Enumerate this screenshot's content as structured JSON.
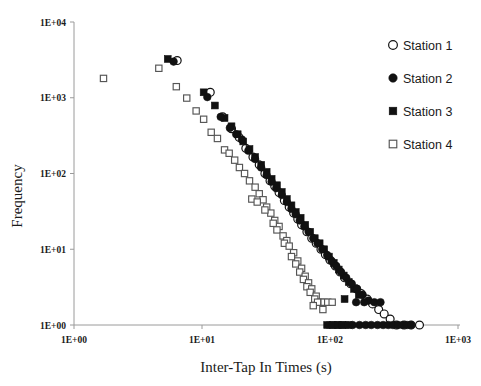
{
  "chart_data": {
    "type": "scatter",
    "title": "",
    "xlabel": "Inter-Tap In Times (s)",
    "ylabel": "Frequency",
    "xscale": "log",
    "yscale": "log",
    "xlim": [
      1,
      1000
    ],
    "ylim": [
      1,
      10000
    ],
    "xticks": [
      "1E+00",
      "1E+01",
      "1E+02",
      "1E+03"
    ],
    "xtick_values": [
      1,
      10,
      100,
      1000
    ],
    "yticks": [
      "1E+00",
      "1E+01",
      "1E+02",
      "1E+03",
      "1E+04"
    ],
    "ytick_values": [
      1,
      10,
      100,
      1000,
      10000
    ],
    "grid": false,
    "legend_position": "right",
    "series": [
      {
        "name": "Station 1",
        "marker": "open-circle",
        "color": "#111111",
        "fill": "#ffffff",
        "points": [
          [
            6.4,
            3100
          ],
          [
            11.6,
            1180
          ],
          [
            14.5,
            560
          ],
          [
            17.0,
            390
          ],
          [
            19.5,
            300
          ],
          [
            22.0,
            215
          ],
          [
            25.0,
            165
          ],
          [
            28.0,
            130
          ],
          [
            31.0,
            100
          ],
          [
            34.0,
            80
          ],
          [
            37.0,
            68
          ],
          [
            40.0,
            56
          ],
          [
            44.0,
            44
          ],
          [
            48.0,
            36
          ],
          [
            52.0,
            30
          ],
          [
            56.0,
            25
          ],
          [
            60.0,
            21
          ],
          [
            66.0,
            17
          ],
          [
            72.0,
            14
          ],
          [
            78.0,
            12
          ],
          [
            85.0,
            10
          ],
          [
            92.0,
            8.5
          ],
          [
            100.0,
            7.2
          ],
          [
            110.0,
            6.0
          ],
          [
            120.0,
            5.0
          ],
          [
            130.0,
            4.2
          ],
          [
            145.0,
            3.5
          ],
          [
            160.0,
            3.0
          ],
          [
            175.0,
            2.6
          ],
          [
            195.0,
            2.2
          ],
          [
            215.0,
            1.9
          ],
          [
            240.0,
            1.6
          ],
          [
            265.0,
            1.4
          ],
          [
            295.0,
            1.2
          ],
          [
            330.0,
            1
          ],
          [
            380.0,
            1
          ],
          [
            430.0,
            1
          ],
          [
            500.0,
            1
          ]
        ]
      },
      {
        "name": "Station 2",
        "marker": "filled-circle",
        "color": "#111111",
        "fill": "#111111",
        "points": [
          [
            6.0,
            3000
          ],
          [
            11.0,
            1020
          ],
          [
            14.0,
            560
          ],
          [
            16.5,
            400
          ],
          [
            18.5,
            330
          ],
          [
            20.5,
            280
          ],
          [
            23.0,
            200
          ],
          [
            26.0,
            155
          ],
          [
            29.0,
            120
          ],
          [
            32.0,
            95
          ],
          [
            35.0,
            78
          ],
          [
            38.0,
            64
          ],
          [
            42.0,
            52
          ],
          [
            46.0,
            42
          ],
          [
            50.0,
            34
          ],
          [
            54.0,
            29
          ],
          [
            58.0,
            24
          ],
          [
            63.0,
            20
          ],
          [
            68.0,
            17
          ],
          [
            74.0,
            14
          ],
          [
            80.0,
            12
          ],
          [
            87.0,
            10
          ],
          [
            95.0,
            8.4
          ],
          [
            103.0,
            7.0
          ],
          [
            112.0,
            6.0
          ],
          [
            122.0,
            5.0
          ],
          [
            134.0,
            4.2
          ],
          [
            148.0,
            3.5
          ],
          [
            163.0,
            3.0
          ],
          [
            180.0,
            2.5
          ],
          [
            200.0,
            2.1
          ],
          [
            222.0,
            2.0
          ],
          [
            248.0,
            2.0
          ],
          [
            160.0,
            2.0
          ],
          [
            185.0,
            2.0
          ],
          [
            150.0,
            1
          ],
          [
            170.0,
            1
          ],
          [
            190.0,
            1
          ],
          [
            210.0,
            1
          ],
          [
            235.0,
            1
          ],
          [
            260.0,
            1
          ],
          [
            285.0,
            1
          ],
          [
            310.0,
            1
          ],
          [
            340.0,
            1
          ],
          [
            370.0,
            1
          ],
          [
            400.0,
            1
          ],
          [
            430.0,
            1
          ]
        ]
      },
      {
        "name": "Station 3",
        "marker": "filled-square",
        "color": "#111111",
        "fill": "#111111",
        "points": [
          [
            5.4,
            3250
          ],
          [
            10.3,
            1180
          ],
          [
            12.6,
            790
          ],
          [
            15.0,
            540
          ],
          [
            17.0,
            420
          ],
          [
            19.0,
            330
          ],
          [
            21.0,
            265
          ],
          [
            23.5,
            210
          ],
          [
            26.0,
            165
          ],
          [
            29.0,
            130
          ],
          [
            32.0,
            105
          ],
          [
            35.0,
            85
          ],
          [
            38.5,
            70
          ],
          [
            42.0,
            57
          ],
          [
            46.0,
            46
          ],
          [
            50.0,
            38
          ],
          [
            54.0,
            31
          ],
          [
            59.0,
            26
          ],
          [
            64.0,
            21
          ],
          [
            70.0,
            17
          ],
          [
            76.0,
            14
          ],
          [
            83.0,
            12
          ],
          [
            90.0,
            10
          ],
          [
            98.0,
            8.0
          ],
          [
            107.0,
            6.6
          ],
          [
            117.0,
            5.4
          ],
          [
            128.0,
            4.5
          ],
          [
            140.0,
            3.7
          ],
          [
            154.0,
            3.0
          ],
          [
            168.0,
            2.5
          ],
          [
            130.0,
            2.2
          ],
          [
            95.0,
            1
          ],
          [
            105.0,
            1
          ],
          [
            115.0,
            1
          ],
          [
            125.0,
            1
          ],
          [
            140.0,
            1
          ]
        ]
      },
      {
        "name": "Station 4",
        "marker": "open-square",
        "color": "#555555",
        "fill": "#ffffff",
        "points": [
          [
            1.7,
            1800
          ],
          [
            4.6,
            2450
          ],
          [
            6.3,
            1400
          ],
          [
            7.6,
            990
          ],
          [
            9.0,
            670
          ],
          [
            10.3,
            520
          ],
          [
            11.8,
            350
          ],
          [
            13.2,
            290
          ],
          [
            15.0,
            205
          ],
          [
            16.3,
            185
          ],
          [
            18.0,
            150
          ],
          [
            19.6,
            120
          ],
          [
            21.5,
            100
          ],
          [
            23.5,
            80
          ],
          [
            26.0,
            66
          ],
          [
            28.0,
            54
          ],
          [
            30.0,
            45
          ],
          [
            24.5,
            46
          ],
          [
            27.0,
            42
          ],
          [
            32.0,
            36
          ],
          [
            34.5,
            30
          ],
          [
            31.0,
            33
          ],
          [
            37.0,
            24
          ],
          [
            40.0,
            20
          ],
          [
            36.0,
            22
          ],
          [
            38.5,
            18
          ],
          [
            43.0,
            15
          ],
          [
            46.0,
            13
          ],
          [
            44.0,
            12
          ],
          [
            48.0,
            11
          ],
          [
            52.0,
            9.0
          ],
          [
            50.0,
            8.0
          ],
          [
            56.0,
            7.0
          ],
          [
            54.0,
            6.4
          ],
          [
            60.0,
            5.6
          ],
          [
            58.0,
            5.0
          ],
          [
            64.0,
            4.4
          ],
          [
            62.0,
            4.0
          ],
          [
            68.0,
            3.6
          ],
          [
            66.0,
            3.2
          ],
          [
            72.0,
            3.0
          ],
          [
            70.0,
            2.7
          ],
          [
            78.0,
            2.4
          ],
          [
            76.0,
            2.2
          ],
          [
            84.0,
            2.0
          ],
          [
            80.0,
            2.0
          ],
          [
            90.0,
            2.0
          ],
          [
            74.0,
            1.8
          ],
          [
            88.0,
            1.6
          ],
          [
            96.0,
            2.0
          ],
          [
            104.0,
            2.0
          ],
          [
            100.0,
            1
          ],
          [
            108.0,
            1
          ],
          [
            116.0,
            1
          ],
          [
            124.0,
            1
          ],
          [
            132.0,
            1
          ],
          [
            112.0,
            1
          ],
          [
            120.0,
            1
          ]
        ]
      }
    ]
  },
  "axes": {
    "x_title": "Inter-Tap In Times (s)",
    "y_title": "Frequency"
  },
  "legend": {
    "items": [
      {
        "label": "Station 1",
        "marker": "open-circle"
      },
      {
        "label": "Station 2",
        "marker": "filled-circle"
      },
      {
        "label": "Station 3",
        "marker": "filled-square"
      },
      {
        "label": "Station 4",
        "marker": "open-square"
      }
    ]
  },
  "colors": {
    "marker_dark": "#111111",
    "marker_outline": "#555555",
    "axis": "#9a9a9a",
    "background": "#ffffff"
  }
}
